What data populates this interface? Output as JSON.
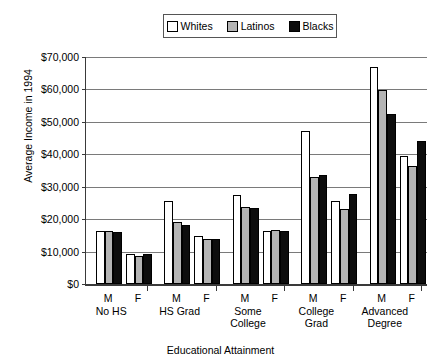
{
  "chart_data": {
    "type": "bar",
    "title": "",
    "xlabel": "Educational Attainment",
    "ylabel": "Average Income in 1994",
    "ylim": [
      0,
      70000
    ],
    "ytick_values": [
      0,
      10000,
      20000,
      30000,
      40000,
      50000,
      60000,
      70000
    ],
    "ytick_labels": [
      "$0",
      "$10,000",
      "$20,000",
      "$30,000",
      "$40,000",
      "$50,000",
      "$60,000",
      "$70,000"
    ],
    "grid": true,
    "legend_position": "top-center",
    "categories": [
      "No HS M",
      "No HS F",
      "HS Grad M",
      "HS Grad F",
      "Some College M",
      "Some College F",
      "College Grad M",
      "College Grad F",
      "Advanced Degree M",
      "Advanced Degree F"
    ],
    "groups": [
      {
        "label": "No HS",
        "sublabels": [
          "M",
          "F"
        ]
      },
      {
        "label": "HS Grad",
        "sublabels": [
          "M",
          "F"
        ]
      },
      {
        "label": "Some College",
        "sublabels": [
          "M",
          "F"
        ]
      },
      {
        "label": "College Grad",
        "sublabels": [
          "M",
          "F"
        ]
      },
      {
        "label": "Advanced Degree",
        "sublabels": [
          "M",
          "F"
        ]
      }
    ],
    "series": [
      {
        "name": "Whites",
        "color": "#ffffff",
        "values": [
          16400,
          9400,
          25500,
          14800,
          27600,
          16500,
          47300,
          25600,
          67000,
          39400
        ]
      },
      {
        "name": "Latinos",
        "color": "#b4b4b4",
        "values": [
          16200,
          8600,
          19100,
          13800,
          23800,
          16800,
          33100,
          23000,
          59700,
          36500
        ]
      },
      {
        "name": "Blacks",
        "color": "#0d0d0d",
        "values": [
          15900,
          9300,
          18100,
          14000,
          23400,
          16200,
          33500,
          27900,
          52500,
          44000
        ]
      }
    ]
  },
  "legend": {
    "items": [
      {
        "label": "Whites"
      },
      {
        "label": "Latinos"
      },
      {
        "label": "Blacks"
      }
    ]
  },
  "axes": {
    "y_title": "Average Income in 1994",
    "x_title": "Educational Attainment"
  }
}
